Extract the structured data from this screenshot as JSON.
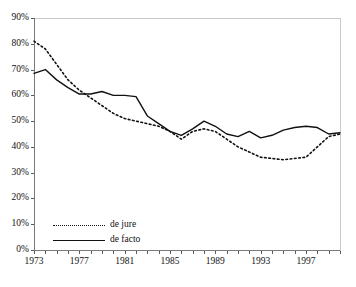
{
  "chart_data": {
    "type": "line",
    "title": "",
    "subtitle": "",
    "xlabel": "",
    "ylabel": "",
    "xlim": [
      1973,
      2000
    ],
    "ylim": [
      0,
      90
    ],
    "grid": false,
    "legend_position": "bottom-left",
    "y_tick_labels": [
      "90%",
      "80%",
      "70%",
      "60%",
      "50%",
      "40%",
      "30%",
      "20%",
      "10%",
      "0%"
    ],
    "y_tick_values": [
      90,
      80,
      70,
      60,
      50,
      40,
      30,
      20,
      10,
      0
    ],
    "x_tick_labels": [
      "1973",
      "1977",
      "1981",
      "1985",
      "1989",
      "1993",
      "1997"
    ],
    "x_tick_values": [
      1973,
      1977,
      1981,
      1985,
      1989,
      1993,
      1997
    ],
    "x_minor_ticks": [
      1973,
      1974,
      1975,
      1976,
      1977,
      1978,
      1979,
      1980,
      1981,
      1982,
      1983,
      1984,
      1985,
      1986,
      1987,
      1988,
      1989,
      1990,
      1991,
      1992,
      1993,
      1994,
      1995,
      1996,
      1997,
      1998,
      1999,
      2000
    ],
    "x": [
      1973,
      1974,
      1975,
      1976,
      1977,
      1978,
      1979,
      1980,
      1981,
      1982,
      1983,
      1984,
      1985,
      1986,
      1987,
      1988,
      1989,
      1990,
      1991,
      1992,
      1993,
      1994,
      1995,
      1996,
      1997,
      1998,
      1999,
      2000
    ],
    "series": [
      {
        "name": "de jure",
        "style": "dotted",
        "color": "#111111",
        "values": [
          81,
          78,
          72,
          66,
          62,
          59,
          56,
          53,
          51,
          50,
          49,
          48,
          46,
          43,
          46,
          47,
          46,
          43,
          40,
          38,
          36,
          35.5,
          35,
          35.5,
          36,
          40,
          44,
          45
        ]
      },
      {
        "name": "de facto",
        "style": "solid",
        "color": "#111111",
        "values": [
          68.5,
          70,
          66,
          63,
          60.5,
          60.5,
          61.5,
          60,
          60,
          59.5,
          52,
          49,
          46,
          44.5,
          47,
          50,
          48,
          45,
          44,
          46,
          43.5,
          44.5,
          46.5,
          47.5,
          48,
          47.5,
          45,
          45.5
        ]
      }
    ]
  },
  "legend": {
    "items": [
      {
        "label": "de jure",
        "style": "dotted"
      },
      {
        "label": "de facto",
        "style": "solid"
      }
    ]
  }
}
